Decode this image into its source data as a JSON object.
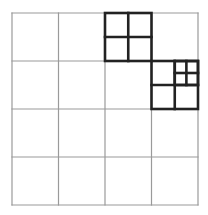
{
  "diagram": {
    "type": "quadtree-grid",
    "grid": {
      "rows": 4,
      "cols": 4,
      "x0": 12,
      "y0": 13,
      "x1": 198,
      "y1": 205,
      "thin_line_color": "#9a9a9a",
      "thick_line_color": "#222222"
    },
    "highlighted_cells": [
      {
        "row": 0,
        "col": 2,
        "subdivision": "2x2",
        "nested": []
      },
      {
        "row": 1,
        "col": 3,
        "subdivision": "2x2",
        "nested": [
          {
            "quadrant": "top-right",
            "subdivision": "2x2"
          }
        ]
      }
    ]
  }
}
